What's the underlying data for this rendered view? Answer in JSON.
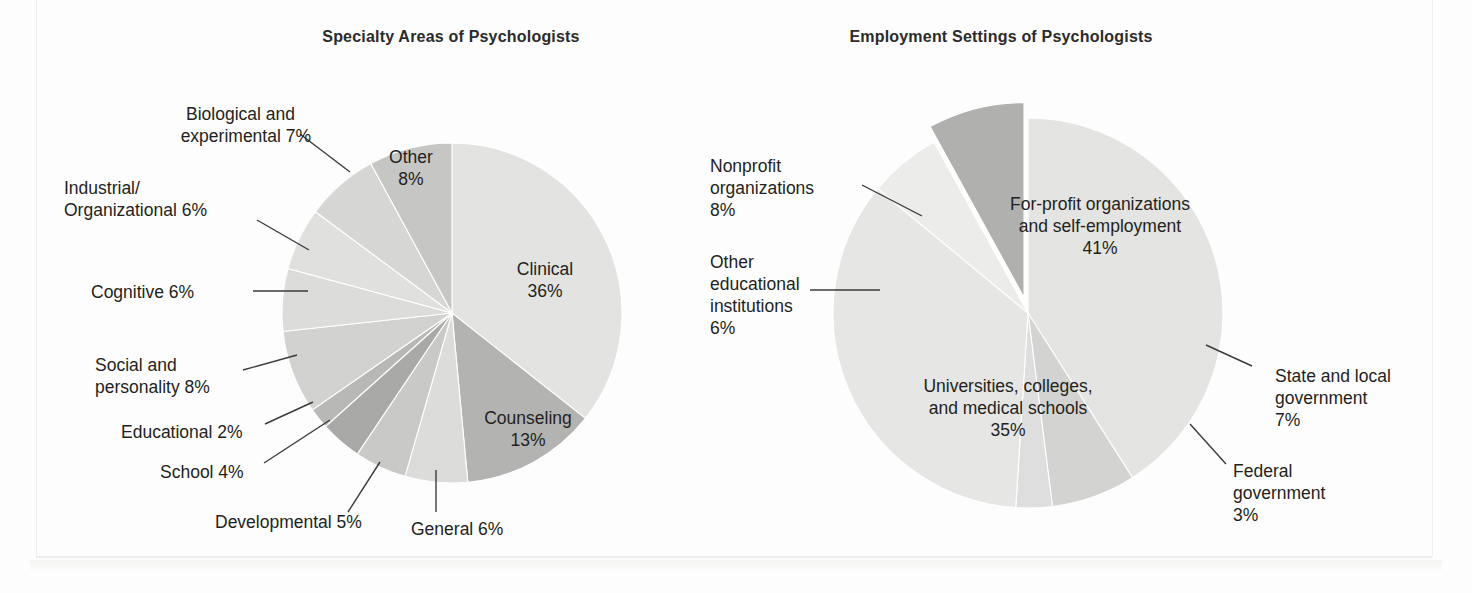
{
  "figure": {
    "background_color": "#fdfdfd",
    "text_color": "#231f20"
  },
  "charts": [
    {
      "id": "specialty-areas",
      "title": "Specialty Areas of Psychologists"
    },
    {
      "id": "employment-settings",
      "title": "Employment Settings of Psychologists"
    }
  ],
  "chart_data": [
    {
      "type": "pie",
      "title": "Specialty Areas of Psychologists",
      "xlabel": "",
      "ylabel": "",
      "units": "percent",
      "legend": "none",
      "labels_position": "inside-and-callout",
      "start_angle_deg": 0,
      "direction": "clockwise",
      "categories": [
        "Clinical",
        "Counseling",
        "General",
        "Developmental",
        "School",
        "Educational",
        "Social and personality",
        "Cognitive",
        "Industrial/Organizational",
        "Biological and experimental",
        "Other"
      ],
      "values": [
        36,
        13,
        6,
        5,
        4,
        2,
        8,
        6,
        6,
        7,
        8
      ],
      "slice_colors": [
        "#e3e3e2",
        "#b3b3b2",
        "#dcdcdb",
        "#c9c9c8",
        "#a9a9a8",
        "#b8b8b7",
        "#d2d2d1",
        "#dcdcdb",
        "#e0e0df",
        "#d6d6d5",
        "#c6c6c5"
      ],
      "labels": [
        {
          "text": "Clinical\n36%",
          "placement": "inside"
        },
        {
          "text": "Counseling\n13%",
          "placement": "inside"
        },
        {
          "text": "General 6%",
          "placement": "callout"
        },
        {
          "text": "Developmental 5%",
          "placement": "callout"
        },
        {
          "text": "School 4%",
          "placement": "callout"
        },
        {
          "text": "Educational 2%",
          "placement": "callout"
        },
        {
          "text": "Social and\npersonality 8%",
          "placement": "callout"
        },
        {
          "text": "Cognitive 6%",
          "placement": "callout"
        },
        {
          "text": "Industrial/\nOrganizational 6%",
          "placement": "callout"
        },
        {
          "text": "Biological and\nexperimental 7%",
          "placement": "callout"
        },
        {
          "text": "Other\n8%",
          "placement": "inside"
        }
      ]
    },
    {
      "type": "pie",
      "title": "Employment Settings of Psychologists",
      "xlabel": "",
      "ylabel": "",
      "units": "percent",
      "legend": "none",
      "labels_position": "inside-and-callout",
      "start_angle_deg": 0,
      "direction": "clockwise",
      "exploded_slices": [
        "Nonprofit organizations"
      ],
      "categories": [
        "For-profit organizations and self-employment",
        "State and local government",
        "Federal government",
        "Universities, colleges, and medical schools",
        "Other educational institutions",
        "Nonprofit organizations"
      ],
      "values": [
        41,
        7,
        3,
        35,
        6,
        8
      ],
      "slice_colors": [
        "#e4e4e3",
        "#d3d3d2",
        "#dedede",
        "#e6e6e5",
        "#ececeb",
        "#b0b0af"
      ],
      "labels": [
        {
          "text": "For-profit organizations\nand self-employment\n41%",
          "placement": "inside"
        },
        {
          "text": "State and local\ngovernment\n7%",
          "placement": "callout"
        },
        {
          "text": "Federal\ngovernment\n3%",
          "placement": "callout"
        },
        {
          "text": "Universities, colleges,\nand medical schools\n35%",
          "placement": "inside"
        },
        {
          "text": "Other\neducational\ninstitutions\n6%",
          "placement": "callout"
        },
        {
          "text": "Nonprofit\norganizations\n8%",
          "placement": "callout"
        }
      ]
    }
  ],
  "left": {
    "title": "Specialty Areas of Psychologists",
    "callouts": {
      "biological_1": "Biological and",
      "biological_2": "experimental 7%",
      "industrial_1": "Industrial/",
      "industrial_2": "Organizational 6%",
      "cognitive": "Cognitive 6%",
      "social_1": "Social and",
      "social_2": "personality 8%",
      "educational": "Educational 2%",
      "school": "School 4%",
      "developmental": "Developmental 5%",
      "general": "General 6%"
    },
    "inside": {
      "other_1": "Other",
      "other_2": "8%",
      "clinical_1": "Clinical",
      "clinical_2": "36%",
      "counseling_1": "Counseling",
      "counseling_2": "13%"
    }
  },
  "right": {
    "title": "Employment Settings of Psychologists",
    "callouts": {
      "nonprofit_1": "Nonprofit",
      "nonprofit_2": "organizations",
      "nonprofit_3": "8%",
      "othered_1": "Other",
      "othered_2": "educational",
      "othered_3": "institutions",
      "othered_4": "6%",
      "state_1": "State and local",
      "state_2": "government",
      "state_3": "7%",
      "federal_1": "Federal",
      "federal_2": "government",
      "federal_3": "3%"
    },
    "inside": {
      "forprofit_1": "For-profit organizations",
      "forprofit_2": "and self-employment",
      "forprofit_3": "41%",
      "univ_1": "Universities, colleges,",
      "univ_2": "and medical schools",
      "univ_3": "35%"
    }
  }
}
